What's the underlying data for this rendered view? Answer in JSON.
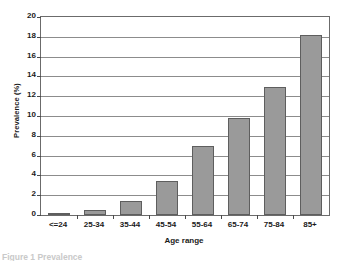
{
  "chart_data": {
    "type": "bar",
    "title": "",
    "xlabel": "Age range",
    "ylabel": "Prevalence (%)",
    "categories": [
      "<=24",
      "25-34",
      "35-44",
      "45-54",
      "55-64",
      "65-74",
      "75-84",
      "85+"
    ],
    "values": [
      0.1,
      0.55,
      1.45,
      3.4,
      7.0,
      9.8,
      12.9,
      18.2
    ],
    "ylim": [
      0,
      20
    ],
    "ytick_step": 2,
    "yticks": [
      "20",
      "18",
      "16",
      "14",
      "12",
      "10",
      "8",
      "6",
      "4",
      "2",
      "0"
    ],
    "ytick_values": [
      20,
      18,
      16,
      14,
      12,
      10,
      8,
      6,
      4,
      2,
      0
    ],
    "grid": true,
    "legend": false,
    "legend_position": "none",
    "bar_color": "#9a9a9a",
    "bar_border_color": "#5e5e5e",
    "gridline_color": "#8c8c8c",
    "axis_color": "#6b6b6b"
  },
  "caption": {
    "text": "Figure 1   Prevalence"
  }
}
